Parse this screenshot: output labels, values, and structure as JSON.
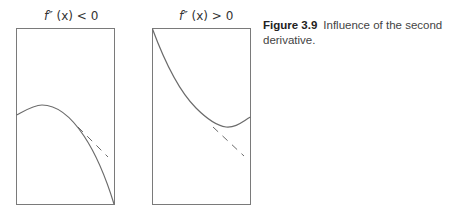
{
  "figure": {
    "label": "Figure 3.9",
    "caption": "Influence of the second derivative."
  },
  "panels": [
    {
      "title_fn": "f″",
      "title_arg": "(x)",
      "title_rel": "< 0",
      "description": "concave-down curve lying below its dashed tangent line"
    },
    {
      "title_fn": "f″",
      "title_arg": "(x)",
      "title_rel": "> 0",
      "description": "concave-up curve lying above its dashed tangent line"
    }
  ],
  "colors": {
    "curve": "#6b6b6b",
    "frame": "#7a7a7a",
    "dash": "#6b6b6b",
    "text": "#333333"
  }
}
